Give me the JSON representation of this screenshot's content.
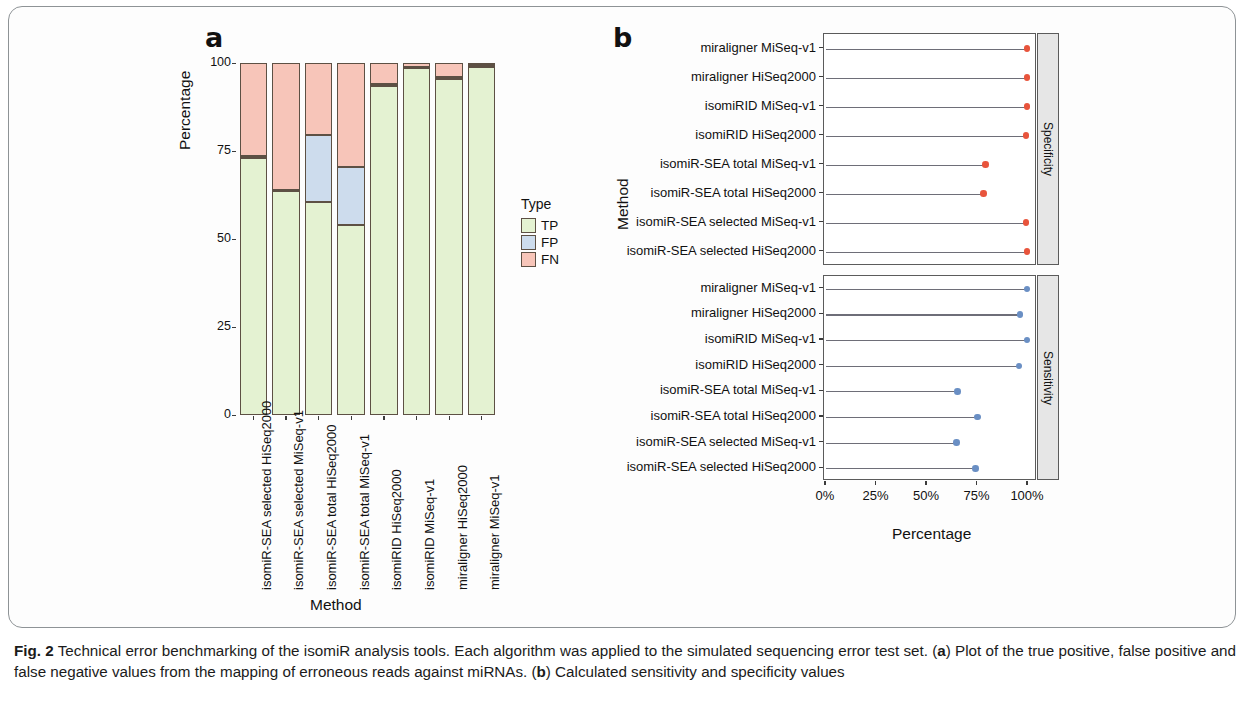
{
  "figure": {
    "panel_a_letter": "a",
    "panel_b_letter": "b",
    "caption_label": "Fig. 2",
    "caption_text": " Technical error benchmarking of the isomiR analysis tools. Each algorithm was applied to the  simulated  sequencing error test set. (",
    "caption_a_marker": "a",
    "caption_text_2": ") Plot of the true positive, false positive and false negative values from the mapping of erroneous reads against miRNAs. (",
    "caption_b_marker": "b",
    "caption_text_3": ") Calculated sensitivity  and  specificity  values"
  },
  "colors": {
    "tp": "#e4f2d2",
    "fp": "#cddced",
    "fn": "#f7c5b9",
    "specificity_dot": "#e8543c",
    "sensitivity_dot": "#6a8fc4",
    "segment_border": "#5d5044",
    "panel_border": "#5b5b5b",
    "strip_fill": "#e6e6e6"
  },
  "panel_a": {
    "ylabel": "Percentage",
    "xlabel": "Method",
    "y_ticks": [
      "0",
      "25",
      "50",
      "75",
      "100"
    ],
    "y_tick_values": [
      0,
      25,
      50,
      75,
      100
    ],
    "legend_title": "Type",
    "legend_items": [
      {
        "label": "TP",
        "color": "#e4f2d2"
      },
      {
        "label": "FP",
        "color": "#cddced"
      },
      {
        "label": "FN",
        "color": "#f7c5b9"
      }
    ]
  },
  "panel_b": {
    "ylabel": "Method",
    "xlabel": "Percentage",
    "x_ticks": [
      "0%",
      "25%",
      "50%",
      "75%",
      "100%"
    ],
    "x_tick_values": [
      0,
      25,
      50,
      75,
      100
    ],
    "facets": [
      {
        "strip_label": "Specificity"
      },
      {
        "strip_label": "Sensitivity"
      }
    ]
  },
  "chart_data": [
    {
      "type": "bar",
      "id": "panel-a-stacked-bar",
      "title": "",
      "xlabel": "Method",
      "ylabel": "Percentage",
      "ylim": [
        0,
        100
      ],
      "stacked": true,
      "orientation": "vertical",
      "grid": false,
      "legend_title": "Type",
      "legend_position": "right",
      "categories": [
        "isomiR-SEA selected HiSeq2000",
        "isomiR-SEA selected MiSeq-v1",
        "isomiR-SEA total HiSeq2000",
        "isomiR-SEA total MiSeq-v1",
        "isomiRID HiSeq2000",
        "isomiRID MiSeq-v1",
        "miraligner HiSeq2000",
        "miraligner MiSeq-v1"
      ],
      "series": [
        {
          "name": "TP",
          "color": "#e4f2d2",
          "values": [
            73.0,
            63.5,
            60.5,
            54.0,
            93.5,
            98.5,
            95.5,
            99.0
          ]
        },
        {
          "name": "FP",
          "color": "#cddced",
          "values": [
            0.5,
            0.5,
            19.0,
            16.5,
            0.5,
            0.5,
            0.5,
            0.5
          ]
        },
        {
          "name": "FN",
          "color": "#f7c5b9",
          "values": [
            26.5,
            36.0,
            20.5,
            29.5,
            6.0,
            1.0,
            4.0,
            0.5
          ]
        }
      ]
    },
    {
      "type": "scatter",
      "id": "panel-b-lollipop",
      "title": "",
      "xlabel": "Percentage",
      "ylabel": "Method",
      "xlim": [
        0,
        100
      ],
      "x_tick_labels": [
        "0%",
        "25%",
        "50%",
        "75%",
        "100%"
      ],
      "grid": false,
      "facets": [
        {
          "name": "Specificity",
          "dot_color": "#e8543c",
          "categories": [
            "miraligner MiSeq-v1",
            "miraligner HiSeq2000",
            "isomiRID MiSeq-v1",
            "isomiRID HiSeq2000",
            "isomiR-SEA total MiSeq-v1",
            "isomiR-SEA total HiSeq2000",
            "isomiR-SEA selected MiSeq-v1",
            "isomiR-SEA selected HiSeq2000"
          ],
          "values": [
            99.5,
            99.5,
            99.5,
            99.0,
            79.0,
            78.0,
            99.0,
            99.5
          ]
        },
        {
          "name": "Sensitivity",
          "dot_color": "#6a8fc4",
          "categories": [
            "miraligner MiSeq-v1",
            "miraligner HiSeq2000",
            "isomiRID MiSeq-v1",
            "isomiRID HiSeq2000",
            "isomiR-SEA total MiSeq-v1",
            "isomiR-SEA total HiSeq2000",
            "isomiR-SEA selected MiSeq-v1",
            "isomiR-SEA selected HiSeq2000"
          ],
          "values": [
            99.5,
            96.0,
            99.5,
            95.5,
            65.0,
            75.0,
            64.5,
            74.0
          ]
        }
      ]
    }
  ]
}
